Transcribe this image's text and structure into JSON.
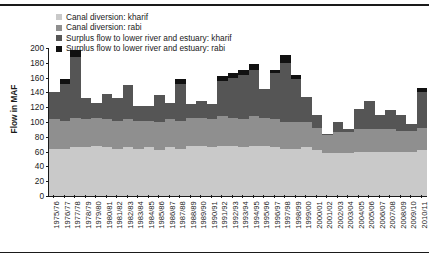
{
  "chart_data": {
    "type": "bar",
    "stacked": true,
    "title": "",
    "xlabel": "",
    "ylabel": "Flow in MAF",
    "ylim": [
      0,
      200
    ],
    "ytick_step": 20,
    "yticks": [
      0,
      20,
      40,
      60,
      80,
      100,
      120,
      140,
      160,
      180,
      200
    ],
    "grid": false,
    "legend_position": "top-left",
    "categories": [
      "1975/76",
      "1976/77",
      "1977/78",
      "1978/79",
      "1979/80",
      "1980/81",
      "1981/82",
      "1982/83",
      "1983/84",
      "1984/85",
      "1985/86",
      "1986/87",
      "1987/88",
      "1988/89",
      "1989/90",
      "1990/91",
      "1991/92",
      "1992/93",
      "1993/94",
      "1994/95",
      "1995/96",
      "1996/97",
      "1997/98",
      "1998/99",
      "1999/00",
      "2000/01",
      "2001/02",
      "2002/03",
      "2003/04",
      "2004/05",
      "2005/06",
      "2006/07",
      "2007/08",
      "2008/09",
      "2009/10",
      "2010/11"
    ],
    "series": [
      {
        "name": "Canal diversion: kharif",
        "color": "#c9c9c9",
        "values": [
          64,
          64,
          66,
          66,
          68,
          66,
          64,
          66,
          64,
          66,
          62,
          66,
          64,
          68,
          68,
          66,
          68,
          68,
          66,
          68,
          68,
          66,
          64,
          64,
          66,
          62,
          58,
          58,
          58,
          60,
          60,
          60,
          60,
          60,
          60,
          62
        ]
      },
      {
        "name": "Canal diversion: rabi",
        "color": "#8f8f8f",
        "values": [
          40,
          38,
          40,
          38,
          38,
          38,
          38,
          38,
          38,
          36,
          38,
          38,
          38,
          38,
          38,
          38,
          40,
          38,
          38,
          40,
          38,
          38,
          36,
          36,
          34,
          30,
          24,
          28,
          28,
          30,
          30,
          30,
          30,
          28,
          28,
          30
        ]
      },
      {
        "name": "Surplus flow to lower river and estuary: kharif",
        "color": "#555555",
        "values": [
          36,
          50,
          82,
          28,
          20,
          34,
          30,
          46,
          20,
          20,
          36,
          22,
          50,
          18,
          22,
          20,
          48,
          54,
          60,
          62,
          38,
          62,
          80,
          58,
          34,
          18,
          2,
          14,
          4,
          28,
          38,
          20,
          26,
          22,
          10,
          48
        ]
      },
      {
        "name": "Surplus flow to lower river and estuary: rabi",
        "color": "#111111",
        "values": [
          0,
          6,
          10,
          0,
          0,
          0,
          0,
          0,
          0,
          0,
          0,
          0,
          6,
          0,
          0,
          0,
          6,
          6,
          6,
          8,
          0,
          4,
          10,
          6,
          0,
          0,
          0,
          0,
          0,
          0,
          0,
          0,
          0,
          0,
          0,
          6
        ]
      }
    ]
  }
}
